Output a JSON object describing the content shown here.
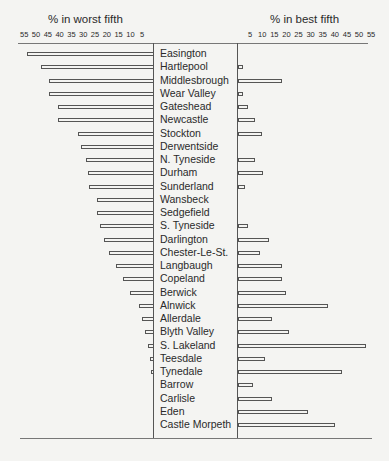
{
  "chart_data": {
    "type": "bar",
    "orientation": "horizontal-diverging",
    "left_title": "% in worst fifth",
    "right_title": "% in best fifth",
    "left_ticks": [
      "55",
      "50",
      "45",
      "40",
      "35",
      "30",
      "25",
      "20",
      "15",
      "10",
      "5"
    ],
    "right_ticks": [
      "5",
      "10",
      "15",
      "20",
      "25",
      "30",
      "35",
      "40",
      "45",
      "50",
      "55"
    ],
    "xlim": [
      0,
      55
    ],
    "grid": false,
    "categories": [
      "Easington",
      "Hartlepool",
      "Middlesbrough",
      "Wear Valley",
      "Gateshead",
      "Newcastle",
      "Stockton",
      "Derwentside",
      "N. Tyneside",
      "Durham",
      "Sunderland",
      "Wansbeck",
      "Sedgefield",
      "S. Tyneside",
      "Darlington",
      "Chester-Le-St.",
      "Langbaugh",
      "Copeland",
      "Berwick",
      "Alnwick",
      "Allerdale",
      "Blyth Valley",
      "S. Lakeland",
      "Teesdale",
      "Tynedale",
      "Barrow",
      "Carlisle",
      "Eden",
      "Castle Morpeth"
    ],
    "series": [
      {
        "name": "% in worst fifth",
        "values": [
          54,
          48,
          44.5,
          44.5,
          40.5,
          40.5,
          32,
          31,
          29,
          28,
          27.5,
          24,
          24,
          23,
          21,
          19,
          16,
          13,
          10,
          6.5,
          5,
          4,
          2.5,
          1.5,
          1,
          0,
          0,
          0,
          0
        ]
      },
      {
        "name": "% in best fifth",
        "values": [
          0,
          2,
          18,
          2,
          4,
          7,
          10,
          0,
          7,
          10.5,
          3,
          0,
          0,
          4,
          13,
          9,
          18,
          18,
          20,
          37,
          14,
          21,
          53,
          11,
          43,
          6,
          14,
          29,
          40
        ]
      }
    ]
  }
}
